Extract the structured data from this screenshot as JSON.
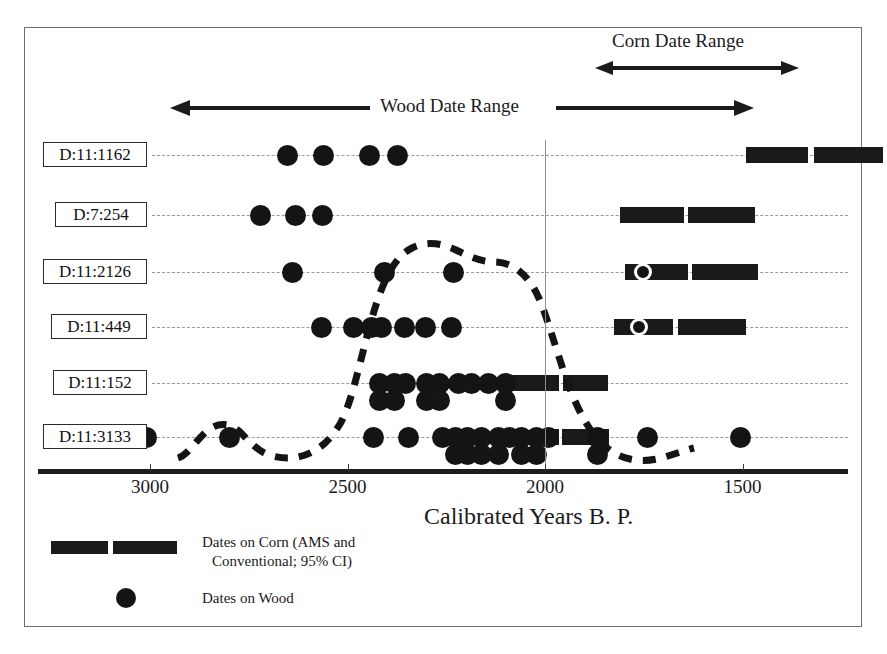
{
  "chart_data": {
    "type": "scatter",
    "title": "",
    "xlabel": "Calibrated Years B. P.",
    "ylabel": "",
    "xlim": [
      3250,
      1270
    ],
    "x_axis_direction": "reversed",
    "xticks": [
      3000,
      2500,
      2000,
      1500
    ],
    "xticklabels": [
      "3000",
      "2500",
      "2000",
      "1500"
    ],
    "grid": "dashed horizontal rows",
    "legend_position": "bottom-left",
    "annotations": [
      {
        "name": "corn-date-range",
        "label": "Corn Date Range",
        "x_start": 2120,
        "x_end": 1610,
        "arrow": "double"
      },
      {
        "name": "wood-date-range",
        "label": "Wood Date Range",
        "x_start": 3050,
        "x_end": 1530,
        "arrow": "double"
      },
      {
        "name": "reference-line",
        "x": 2005
      }
    ],
    "series": [
      {
        "name": "Dates on Corn (AMS and Conventional; 95% CI)",
        "marker": "bar"
      },
      {
        "name": "Dates on Wood",
        "marker": "circle"
      },
      {
        "name": "Probability distribution",
        "marker": "dashed-curve"
      }
    ],
    "rows": [
      {
        "label": "D:11:1162",
        "wood_dates": [
          2651,
          2560,
          2444,
          2373
        ],
        "corn_bars": [
          [
            1492,
            1335
          ],
          [
            1318,
            1145
          ]
        ],
        "corn_ring": null
      },
      {
        "label": "D:7:254",
        "wood_dates": [
          2720,
          2631,
          2563
        ],
        "corn_bars": [
          [
            1810,
            1648
          ],
          [
            1638,
            1468
          ]
        ],
        "corn_ring": null
      },
      {
        "label": "D:11:2126",
        "wood_dates": [
          2640,
          2407,
          2232
        ],
        "corn_bars": [
          [
            1797,
            1638
          ],
          [
            1628,
            1460
          ]
        ],
        "corn_ring": 1751
      },
      {
        "label": "D:11:449",
        "wood_dates": [
          2565,
          2484,
          2438,
          2413,
          2355,
          2302,
          2236
        ],
        "corn_bars": [
          [
            1825,
            1675
          ],
          [
            1663,
            1490
          ]
        ],
        "corn_ring": 1763
      },
      {
        "label": "D:11:152",
        "wood_dates": [
          3153,
          3112,
          2419,
          2419,
          2380,
          2380,
          2353,
          2300,
          2300,
          2266,
          2266,
          2220,
          2186,
          2142,
          2101,
          2101
        ],
        "corn_bars": [
          [
            2085,
            1965
          ],
          [
            1955,
            1840
          ]
        ],
        "corn_ring": null
      },
      {
        "label": "D:11:3133",
        "wood_dates": [
          3008,
          2798,
          2435,
          2346,
          2260,
          2227,
          2227,
          2195,
          2195,
          2160,
          2160,
          2118,
          2118,
          2090,
          2060,
          2060,
          2022,
          2022,
          1990,
          1867,
          1867,
          1740,
          1505
        ],
        "corn_bars": [
          [
            2030,
            1965
          ],
          [
            1958,
            1838
          ]
        ],
        "corn_ring": 2026
      }
    ],
    "probability_curve": {
      "description": "dashed bimodal distribution curve overlaying the rows",
      "peak_x": 2130,
      "minor_peak_x": 2860
    }
  },
  "legend": {
    "corn_label_line1": "Dates on Corn (AMS and",
    "corn_label_line2": "Conventional; 95% CI)",
    "wood_label": "Dates on Wood"
  },
  "labels": {
    "corn_range": "Corn Date Range",
    "wood_range": "Wood Date Range",
    "axis_title": "Calibrated Years B. P."
  },
  "colors": {
    "ink": "#141414",
    "grid": "#9a9a9a",
    "frame": "#6f6f6f",
    "background": "#ffffff"
  }
}
